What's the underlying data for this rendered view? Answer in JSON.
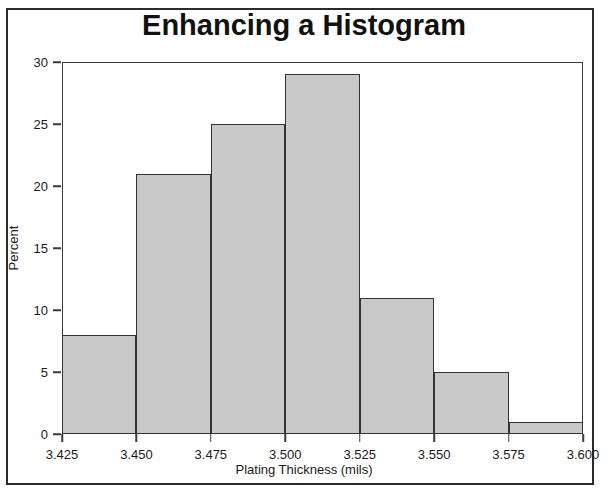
{
  "chart_data": {
    "type": "bar",
    "title": "Enhancing a Histogram",
    "xlabel": "Plating Thickness (mils)",
    "ylabel": "Percent",
    "categories": [
      "3.425-3.450",
      "3.450-3.475",
      "3.475-3.500",
      "3.500-3.525",
      "3.525-3.550",
      "3.550-3.575",
      "3.575-3.600"
    ],
    "bin_edges": [
      3.425,
      3.45,
      3.475,
      3.5,
      3.525,
      3.55,
      3.575,
      3.6
    ],
    "values": [
      8,
      21,
      25,
      29,
      11,
      5,
      1
    ],
    "xlim": [
      3.425,
      3.6
    ],
    "ylim": [
      0,
      30
    ],
    "x_ticks": [
      "3.425",
      "3.450",
      "3.475",
      "3.500",
      "3.525",
      "3.550",
      "3.575",
      "3.600"
    ],
    "x_tick_values": [
      3.425,
      3.45,
      3.475,
      3.5,
      3.525,
      3.55,
      3.575,
      3.6
    ],
    "y_ticks": [
      "0",
      "5",
      "10",
      "15",
      "20",
      "25",
      "30"
    ],
    "y_tick_values": [
      0,
      5,
      10,
      15,
      20,
      25,
      30
    ],
    "grid": false,
    "legend": null,
    "bar_fill_color": "#c9c9c9",
    "bar_border_color": "#333333",
    "axis_color": "#3a3a3a",
    "frame_color": "#2b2b2b",
    "background_color": "#ffffff",
    "text_color": "#111111"
  }
}
